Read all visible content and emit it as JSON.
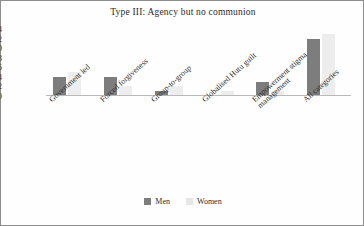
{
  "chart_data": {
    "type": "bar",
    "title": "Type III: Agency but no communion",
    "xlabel": "",
    "ylabel": "",
    "ylim": [
      0,
      14
    ],
    "yticks": [
      14,
      12,
      10,
      8,
      6,
      4,
      2,
      0
    ],
    "grid": false,
    "legend_position": "bottom",
    "categories": [
      "Government led",
      "Forced forgiveness",
      "Group-to-group",
      "Globalised Hutu guilt",
      "Empowerment stigma\nmanagement",
      "All categories"
    ],
    "series": [
      {
        "name": "Men",
        "color": "#7d7d7d",
        "values": [
          4,
          4,
          1,
          0,
          3,
          12
        ]
      },
      {
        "name": "Women",
        "color": "#ededed",
        "values": [
          5,
          2,
          2,
          1,
          1,
          13
        ]
      }
    ]
  }
}
